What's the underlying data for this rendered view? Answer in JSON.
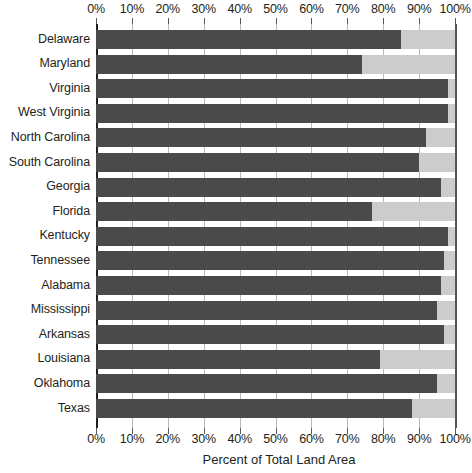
{
  "chart_data": {
    "type": "bar",
    "orientation": "horizontal",
    "title": "",
    "xlabel": "Percent of Total Land Area",
    "ylabel": "",
    "xlim": [
      0,
      100
    ],
    "grid": true,
    "legend": "none",
    "tick_labels": [
      "0%",
      "10%",
      "20%",
      "30%",
      "40%",
      "50%",
      "60%",
      "70%",
      "80%",
      "90%",
      "100%"
    ],
    "tick_values": [
      0,
      10,
      20,
      30,
      40,
      50,
      60,
      70,
      80,
      90,
      100
    ],
    "categories": [
      "Delaware",
      "Maryland",
      "Virginia",
      "West Virginia",
      "North Carolina",
      "South Carolina",
      "Georgia",
      "Florida",
      "Kentucky",
      "Tennessee",
      "Alabama",
      "Mississippi",
      "Arkansas",
      "Louisiana",
      "Oklahoma",
      "Texas"
    ],
    "values": [
      85,
      74,
      98,
      98,
      92,
      90,
      96,
      77,
      98,
      97,
      96,
      95,
      97,
      79,
      95,
      88
    ],
    "series": [
      {
        "name": "Percent of Total Land Area",
        "color": "#4a4a4a",
        "values": [
          85,
          74,
          98,
          98,
          92,
          90,
          96,
          77,
          98,
          97,
          96,
          95,
          97,
          79,
          95,
          88
        ]
      },
      {
        "name": "Remainder",
        "color": "#cccccc",
        "values": [
          15,
          26,
          2,
          2,
          8,
          10,
          4,
          23,
          2,
          3,
          4,
          5,
          3,
          21,
          5,
          12
        ]
      }
    ],
    "colors": {
      "bar_fill": "#4a4a4a",
      "bar_background": "#cccccc",
      "gridline": "#b8b8b8",
      "axis": "#231f20",
      "text": "#231f20",
      "plot_background": "#ffffff"
    }
  }
}
